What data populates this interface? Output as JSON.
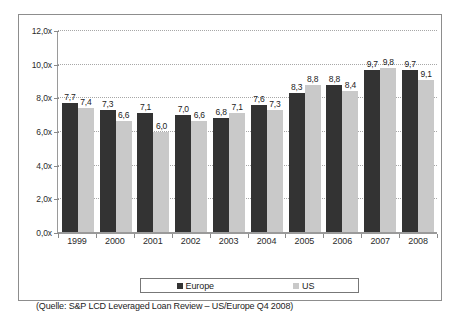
{
  "chart_data": {
    "type": "bar",
    "title": "",
    "subtitle": "",
    "xlabel": "",
    "ylabel": "",
    "categories": [
      "1999",
      "2000",
      "2001",
      "2002",
      "2003",
      "2004",
      "2005",
      "2006",
      "2007",
      "2008"
    ],
    "series": [
      {
        "name": "Europe",
        "color": "#333333",
        "values": [
          7.7,
          7.3,
          7.1,
          7.0,
          6.8,
          7.6,
          8.3,
          8.8,
          9.7,
          9.7
        ],
        "labels": [
          "7,7",
          "7,3",
          "7,1",
          "7,0",
          "6,8",
          "7,6",
          "8,3",
          "8,8",
          "9,7",
          "9,7"
        ]
      },
      {
        "name": "US",
        "color": "#c9c9c9",
        "values": [
          7.4,
          6.6,
          6.0,
          6.6,
          7.1,
          7.3,
          8.8,
          8.4,
          9.8,
          9.1
        ],
        "labels": [
          "7,4",
          "6,6",
          "6,0",
          "6,6",
          "7,1",
          "7,3",
          "8,8",
          "8,4",
          "9,8",
          "9,1"
        ]
      }
    ],
    "ylim": [
      0,
      12
    ],
    "yticks": [
      0,
      2,
      4,
      6,
      8,
      10,
      12
    ],
    "ytick_labels": [
      "0,0x",
      "2,0x",
      "4,0x",
      "6,0x",
      "8,0x",
      "10,0x",
      "12,0x"
    ],
    "grid": "horizontal-dotted",
    "legend_position": "bottom"
  },
  "legend": {
    "entries": [
      {
        "label": "Europe",
        "swatch": "dark-square-icon"
      },
      {
        "label": "US",
        "swatch": "light-square-icon"
      }
    ]
  },
  "source": {
    "text": "(Quelle: S&P LCD Leveraged Loan Review – US/Europe Q4 2008)"
  }
}
